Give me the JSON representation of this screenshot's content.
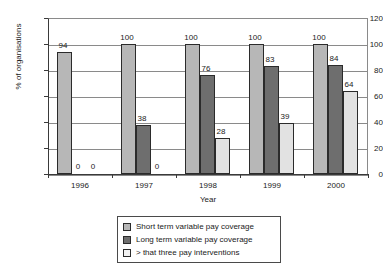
{
  "chart_data": {
    "type": "bar",
    "title": "",
    "subtitle": "",
    "xlabel": "Year",
    "ylabel": "% of organisations",
    "categories": [
      "1996",
      "1997",
      "1998",
      "1999",
      "2000"
    ],
    "series": [
      {
        "name": "Short term variable pay coverage",
        "color": "#b7b7b7",
        "values": [
          94,
          100,
          100,
          100,
          100
        ]
      },
      {
        "name": "Long term variable pay coverage",
        "color": "#6e6e6e",
        "values": [
          0,
          38,
          76,
          83,
          84
        ]
      },
      {
        "name": "> that three pay interventions",
        "color": "#e2e2e2",
        "values": [
          0,
          0,
          28,
          39,
          64
        ]
      }
    ],
    "data_labels": [
      [
        "94",
        "0",
        "0"
      ],
      [
        "100",
        "38",
        "0"
      ],
      [
        "100",
        "76",
        "28"
      ],
      [
        "100",
        "83",
        "39"
      ],
      [
        "100",
        "84",
        "64"
      ]
    ],
    "ylim": [
      0,
      120
    ],
    "yticks": [
      0,
      20,
      40,
      60,
      80,
      100,
      120
    ],
    "ytick_labels": [
      "0",
      "20",
      "40",
      "60",
      "80",
      "100",
      "120"
    ],
    "grid": true,
    "grid_axis": "y",
    "legend_position": "bottom"
  },
  "legend": {
    "items": [
      {
        "label": "Short term variable pay coverage",
        "swatch": "legend-swatch-short-term"
      },
      {
        "label": "Long term variable pay coverage",
        "swatch": "legend-swatch-long-term"
      },
      {
        "label": "> that three pay interventions",
        "swatch": "legend-swatch-three-interventions"
      }
    ]
  }
}
